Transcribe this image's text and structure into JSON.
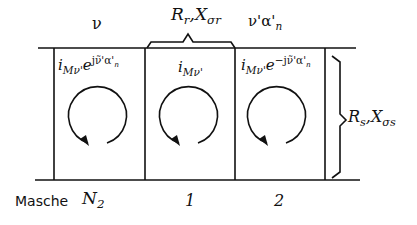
{
  "diagram": {
    "type": "mesh-circuit",
    "top_labels": {
      "nu": "ν",
      "rotor_impedance_R": "R",
      "rotor_impedance_R_sub": "r",
      "rotor_impedance_sep": ",",
      "rotor_impedance_X": "X",
      "rotor_impedance_X_sub": "σr",
      "phase_label": "ν'α'",
      "phase_label_sub": "n"
    },
    "right_label": {
      "R": "R",
      "R_sub": "s",
      "sep": ",",
      "X": "X",
      "X_sub": "σs"
    },
    "meshes": [
      {
        "id": "N2",
        "current_base": "i",
        "current_sub": "Mν'",
        "factor": "e",
        "exponent": "jν̃'α'",
        "exponent_sub": "n",
        "bottom_label": "N",
        "bottom_label_sub": "2"
      },
      {
        "id": "1",
        "current_base": "i",
        "current_sub": "Mν'",
        "factor": "",
        "exponent": "",
        "exponent_sub": "",
        "bottom_label": "1",
        "bottom_label_sub": ""
      },
      {
        "id": "2",
        "current_base": "i",
        "current_sub": "Mν'",
        "factor": "e",
        "exponent": "−jν̃'α'",
        "exponent_sub": "n",
        "bottom_label": "2",
        "bottom_label_sub": ""
      }
    ],
    "row_label": "Masche"
  }
}
